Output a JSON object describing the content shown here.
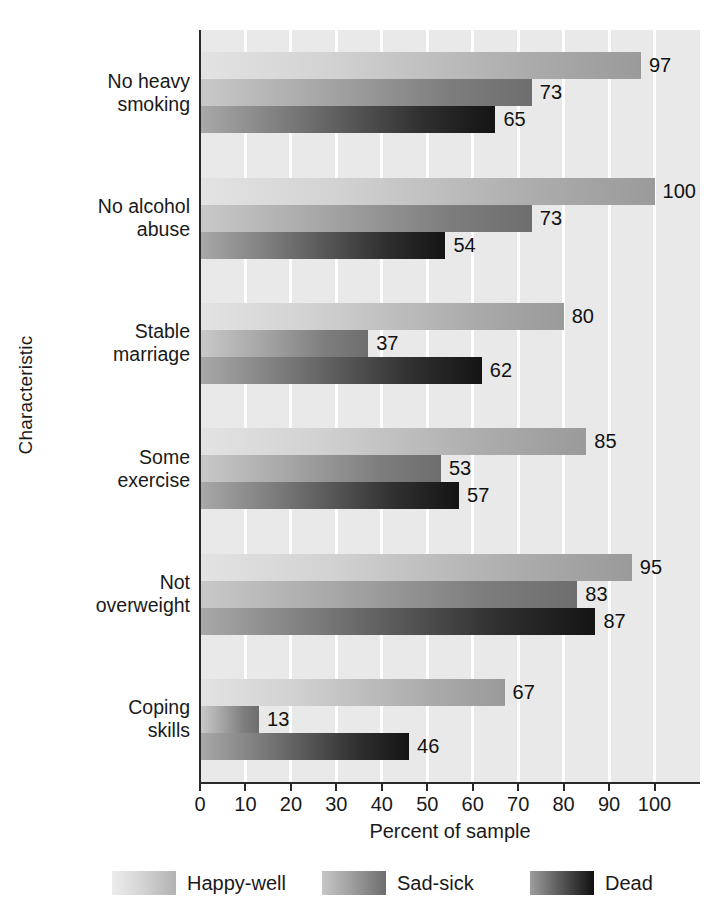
{
  "chart_data": {
    "type": "bar",
    "orientation": "horizontal",
    "title": "",
    "xlabel": "Percent of sample",
    "ylabel": "Characteristic",
    "xlim": [
      0,
      110
    ],
    "xticks": [
      0,
      10,
      20,
      30,
      40,
      50,
      60,
      70,
      80,
      90,
      100
    ],
    "grid": true,
    "grid_axis": "x",
    "legend_position": "bottom",
    "categories": [
      "No heavy\nsmoking",
      "No alcohol\nabuse",
      "Stable\nmarriage",
      "Some\nexercise",
      "Not\noverweight",
      "Coping\nskills"
    ],
    "series": [
      {
        "name": "Happy-well",
        "color": "#c6c6c6",
        "values": [
          97,
          100,
          80,
          85,
          95,
          67
        ]
      },
      {
        "name": "Sad-sick",
        "color": "#8a8a8a",
        "values": [
          73,
          73,
          37,
          53,
          83,
          13
        ]
      },
      {
        "name": "Dead",
        "color": "#2a2a2a",
        "values": [
          65,
          54,
          62,
          57,
          87,
          46
        ]
      }
    ]
  },
  "axis": {
    "x_title": "Percent of sample",
    "y_title": "Characteristic",
    "x_tick_labels": [
      "0",
      "10",
      "20",
      "30",
      "40",
      "50",
      "60",
      "70",
      "80",
      "90",
      "100"
    ]
  },
  "legend": {
    "entries": [
      {
        "label": "Happy-well"
      },
      {
        "label": "Sad-sick"
      },
      {
        "label": "Dead"
      }
    ]
  },
  "colors": {
    "plot_background": "#e9e9e9",
    "gridline": "#ffffff",
    "axis": "#2a2a2a",
    "text": "#1a1a1a"
  }
}
